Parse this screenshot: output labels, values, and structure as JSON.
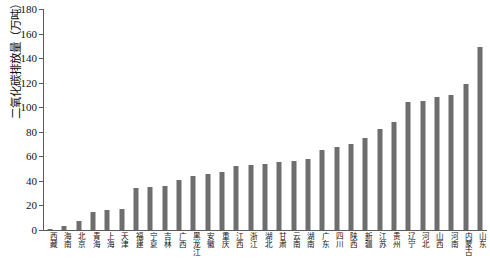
{
  "chart_data": {
    "type": "bar",
    "title": "",
    "xlabel": "",
    "ylabel": "二氧化碳排放量（万吨）",
    "ylim": [
      0,
      180
    ],
    "yticks": [
      0,
      20,
      40,
      60,
      80,
      100,
      120,
      140,
      160,
      180
    ],
    "grid": false,
    "legend": "none",
    "bar_color": "#6e6e6e",
    "axis_color": "#5a5a5a",
    "categories": [
      "西藏",
      "海南",
      "北京",
      "青海",
      "上海",
      "天津",
      "福建",
      "宁夏",
      "吉林",
      "广西",
      "黑龙江",
      "安徽",
      "重庆",
      "江西",
      "浙江",
      "湖北",
      "甘肃",
      "云南",
      "湖南",
      "广东",
      "四川",
      "陕西",
      "新疆",
      "江苏",
      "贵州",
      "辽宁",
      "河北",
      "山西",
      "河南",
      "内蒙古",
      "山东"
    ],
    "values": [
      1,
      3,
      7,
      15,
      16,
      17,
      34,
      35,
      36,
      41,
      44,
      46,
      47,
      52,
      53,
      54,
      55,
      56,
      58,
      65,
      68,
      70,
      75,
      82,
      88,
      104,
      105,
      108,
      110,
      119,
      149
    ],
    "units": "万吨"
  }
}
